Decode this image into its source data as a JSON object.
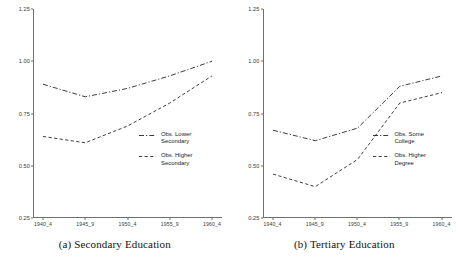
{
  "figure": {
    "panels": [
      {
        "caption": "(a) Secondary Education",
        "legend_position": "inside-right-lower"
      },
      {
        "caption": "(b) Tertiary Education",
        "legend_position": "inside-right-lower"
      }
    ]
  },
  "chart_data": [
    {
      "type": "line",
      "title": "(a) Secondary Education",
      "xlabel": "",
      "ylabel": "",
      "x": [
        "1940_4",
        "1945_9",
        "1950_4",
        "1955_9",
        "1960_4"
      ],
      "categories": [
        "1940_4",
        "1945_9",
        "1950_4",
        "1955_9",
        "1960_4"
      ],
      "ylim": [
        0.25,
        1.25
      ],
      "yticks": [
        0.25,
        0.5,
        0.75,
        1.0,
        1.25
      ],
      "ytick_labels": [
        "0.25",
        "0.50",
        "0.75",
        "1.00",
        "1.25"
      ],
      "grid": false,
      "legend_position": "lower right",
      "series": [
        {
          "name": "Obs. Lower Secondary",
          "style": "dash-dot",
          "color": "#1a1a1a",
          "values": [
            0.89,
            0.83,
            0.87,
            0.93,
            1.0
          ]
        },
        {
          "name": "Obs. Higher Secondary",
          "style": "dashed",
          "color": "#1a1a1a",
          "values": [
            0.64,
            0.61,
            0.69,
            0.8,
            0.93
          ]
        }
      ]
    },
    {
      "type": "line",
      "title": "(b) Tertiary Education",
      "xlabel": "",
      "ylabel": "",
      "x": [
        "1940_4",
        "1945_9",
        "1950_4",
        "1955_9",
        "1960_4"
      ],
      "categories": [
        "1940_4",
        "1945_9",
        "1950_4",
        "1955_9",
        "1960_4"
      ],
      "ylim": [
        0.25,
        1.25
      ],
      "yticks": [
        0.25,
        0.5,
        0.75,
        1.0,
        1.25
      ],
      "ytick_labels": [
        "0.25",
        "0.50",
        "0.75",
        "1.00",
        "1.25"
      ],
      "grid": false,
      "legend_position": "lower right",
      "series": [
        {
          "name": "Obs. Some College",
          "style": "dash-dot",
          "color": "#1a1a1a",
          "values": [
            0.67,
            0.62,
            0.68,
            0.88,
            0.93
          ]
        },
        {
          "name": "Obs. Higher Degree",
          "style": "dashed",
          "color": "#1a1a1a",
          "values": [
            0.46,
            0.4,
            0.53,
            0.8,
            0.85
          ]
        }
      ]
    }
  ]
}
